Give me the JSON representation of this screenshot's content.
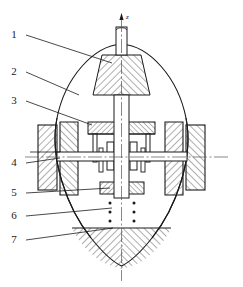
{
  "figure": {
    "type": "engineering-cross-section",
    "title": "",
    "background_color": "#ffffff",
    "line_color": "#1a1a1a",
    "hatch_color": "#333333",
    "centerline_color": "#555555"
  },
  "axis": {
    "vertical_label": "z",
    "vertical_arrow": true,
    "horizontal_centerline": true
  },
  "callouts": [
    {
      "id": "1",
      "label": "1",
      "text_x": 14,
      "text_y": 38,
      "leader": {
        "x1": 26,
        "y1": 35,
        "x2": 112,
        "y2": 63
      }
    },
    {
      "id": "2",
      "label": "2",
      "text_x": 14,
      "text_y": 75,
      "leader": {
        "x1": 26,
        "y1": 72,
        "x2": 79,
        "y2": 95
      }
    },
    {
      "id": "3",
      "label": "3",
      "text_x": 14,
      "text_y": 104,
      "leader": {
        "x1": 26,
        "y1": 101,
        "x2": 92,
        "y2": 125
      }
    },
    {
      "id": "4",
      "label": "4",
      "text_x": 14,
      "text_y": 166,
      "leader": {
        "x1": 26,
        "y1": 163,
        "x2": 60,
        "y2": 158
      }
    },
    {
      "id": "5",
      "label": "5",
      "text_x": 14,
      "text_y": 196,
      "leader": {
        "x1": 26,
        "y1": 193,
        "x2": 110,
        "y2": 188
      }
    },
    {
      "id": "6",
      "label": "6",
      "text_x": 14,
      "text_y": 219,
      "leader": {
        "x1": 26,
        "y1": 216,
        "x2": 112,
        "y2": 208
      }
    },
    {
      "id": "7",
      "label": "7",
      "text_x": 14,
      "text_y": 243,
      "leader": {
        "x1": 26,
        "y1": 240,
        "x2": 113,
        "y2": 228
      }
    }
  ],
  "components": {
    "hull": {
      "name": "teardrop-hull-outline"
    },
    "top_cone": {
      "name": "upper-conical-hatched-section"
    },
    "bottom_ballast": {
      "name": "lower-hatched-ballast-section"
    },
    "vertical_shaft": {
      "name": "vertical-shaft"
    },
    "horizontal_shaft": {
      "name": "horizontal-shaft"
    },
    "upper_plate": {
      "name": "upper-mounting-plate"
    },
    "lower_plate": {
      "name": "lower-mounting-plate"
    },
    "bearings": {
      "name": "bearing-blocks",
      "count": 4
    },
    "wheels_left": {
      "name": "left-wheel-pair",
      "count": 2
    },
    "wheels_right": {
      "name": "right-wheel-pair",
      "count": 2
    },
    "dot_columns": {
      "name": "dot-columns",
      "columns": 2,
      "dots_per_column": 3
    }
  }
}
